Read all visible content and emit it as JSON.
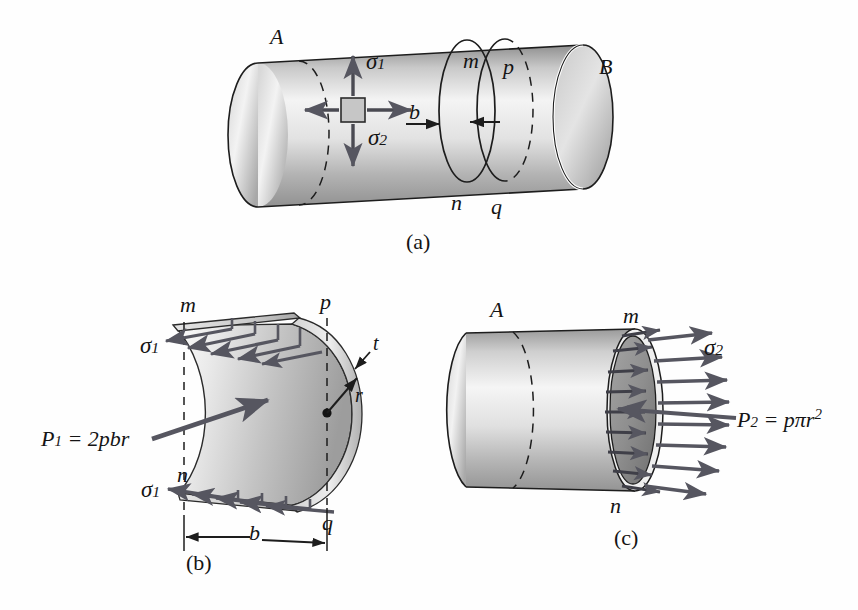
{
  "figure": {
    "background": "#fefefe",
    "ink": "#141414",
    "arrow_color": "#4a4a52",
    "shell_light": "#f2f2f2",
    "shell_mid": "#b9b9b9",
    "shell_dark": "#8b8b8b",
    "inner_face_dark": "#8a8a8a"
  },
  "panels": [
    {
      "id": "a",
      "caption": "(a)",
      "description": "Cylindrical pressure vessel with stress element showing sigma 1 and sigma 2, cut sections m-n and p-q separated by distance b",
      "labels": [
        {
          "name": "end-label-A",
          "text": "A"
        },
        {
          "name": "end-label-B",
          "text": "B"
        },
        {
          "name": "section-label-m",
          "text": "m"
        },
        {
          "name": "section-label-n",
          "text": "n"
        },
        {
          "name": "section-label-p",
          "text": "p"
        },
        {
          "name": "section-label-q",
          "text": "q"
        },
        {
          "name": "dimension-label-b",
          "text": "b"
        }
      ],
      "stress_element": {
        "name": "stress-element",
        "sigma1": {
          "symbol": "σ",
          "subscript": "1",
          "direction": "vertical-hoop"
        },
        "sigma2": {
          "symbol": "σ",
          "subscript": "2",
          "direction": "horizontal-longitudinal"
        }
      }
    },
    {
      "id": "b",
      "caption": "(b)",
      "description": "Free body of half shell of width b, circumferential stress sigma 1 on cut faces, resultant pressure force P1",
      "labels": [
        {
          "name": "corner-label-m",
          "text": "m"
        },
        {
          "name": "corner-label-n",
          "text": "n"
        },
        {
          "name": "corner-label-p",
          "text": "p"
        },
        {
          "name": "corner-label-q",
          "text": "q"
        },
        {
          "name": "thickness-label-t",
          "text": "t"
        },
        {
          "name": "radius-label-r",
          "text": "r"
        },
        {
          "name": "dimension-label-b",
          "text": "b"
        }
      ],
      "stress_top": {
        "symbol": "σ",
        "subscript": "1"
      },
      "stress_bottom": {
        "symbol": "σ",
        "subscript": "1"
      },
      "force_equation": {
        "name": "force-equation-P1",
        "lhs": "P",
        "lhs_sub": "1",
        "rhs": " = 2pbr",
        "full": "P₁ = 2pbr"
      }
    },
    {
      "id": "c",
      "caption": "(c)",
      "description": "Free body of cylinder end, longitudinal stress sigma 2 on cut cross-section m-n, resultant pressure force P2",
      "labels": [
        {
          "name": "end-label-A",
          "text": "A"
        },
        {
          "name": "section-label-m",
          "text": "m"
        },
        {
          "name": "section-label-n",
          "text": "n"
        }
      ],
      "stress_label": {
        "symbol": "σ",
        "subscript": "2"
      },
      "force_equation": {
        "name": "force-equation-P2",
        "lhs": "P",
        "lhs_sub": "2",
        "rhs": " = pπr",
        "exponent": "2",
        "full": "P₂ = pπr²"
      }
    }
  ]
}
